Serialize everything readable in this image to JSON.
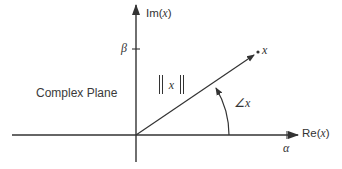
{
  "diagram": {
    "title": "Complex Plane",
    "axes": {
      "imaginary": {
        "label_prefix": "Im(",
        "label_var": "x",
        "label_suffix": ")",
        "tick_label": "β"
      },
      "real": {
        "label_prefix": "Re(",
        "label_var": "x",
        "label_suffix": ")",
        "tick_label": "α"
      }
    },
    "vector": {
      "endpoint_label": "x",
      "magnitude_label": "x",
      "angle_label": "∠x"
    },
    "colors": {
      "stroke": "#333333",
      "background": "#ffffff",
      "text": "#333333"
    }
  }
}
